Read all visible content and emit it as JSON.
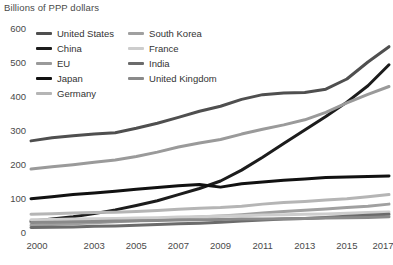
{
  "chart_data": {
    "type": "line",
    "title": "",
    "ylabel": "Billions of PPP dollars",
    "xlabel": "",
    "ylim": [
      0,
      600
    ],
    "yticks": [
      0,
      100,
      200,
      300,
      400,
      500,
      600
    ],
    "xticks": [
      "2000",
      "2003",
      "2005",
      "2007",
      "2009",
      "2011",
      "2013",
      "2015",
      "2017"
    ],
    "x": [
      2000,
      2001,
      2002,
      2003,
      2004,
      2005,
      2006,
      2007,
      2008,
      2009,
      2010,
      2011,
      2012,
      2013,
      2014,
      2015,
      2016,
      2017
    ],
    "grid": false,
    "legend_position": "top-left",
    "series": [
      {
        "name": "United States",
        "color": "#4f4f4f",
        "width": 3.0,
        "values": [
          268,
          277,
          283,
          288,
          292,
          305,
          320,
          337,
          355,
          370,
          390,
          404,
          409,
          410,
          420,
          450,
          500,
          545
        ]
      },
      {
        "name": "China",
        "color": "#1c1c1c",
        "width": 3.0,
        "values": [
          32,
          38,
          45,
          54,
          65,
          78,
          92,
          110,
          128,
          150,
          182,
          220,
          260,
          300,
          340,
          382,
          430,
          492
        ]
      },
      {
        "name": "EU",
        "color": "#9a9a9a",
        "width": 3.0,
        "values": [
          185,
          192,
          198,
          205,
          212,
          222,
          235,
          250,
          262,
          272,
          288,
          302,
          315,
          330,
          352,
          380,
          405,
          428
        ]
      },
      {
        "name": "Japan",
        "color": "#111111",
        "width": 3.0,
        "values": [
          98,
          104,
          110,
          115,
          120,
          126,
          131,
          136,
          140,
          132,
          142,
          147,
          152,
          156,
          160,
          162,
          163,
          165
        ]
      },
      {
        "name": "Germany",
        "color": "#b5b5b5",
        "width": 3.0,
        "values": [
          52,
          54,
          56,
          57,
          58,
          60,
          63,
          67,
          70,
          72,
          76,
          82,
          87,
          90,
          94,
          98,
          104,
          110
        ]
      },
      {
        "name": "South Korea",
        "color": "#a0a0a0",
        "width": 3.0,
        "values": [
          20,
          22,
          24,
          27,
          30,
          33,
          37,
          41,
          44,
          47,
          51,
          56,
          60,
          64,
          68,
          72,
          76,
          82
        ]
      },
      {
        "name": "France",
        "color": "#cdcdcd",
        "width": 3.0,
        "values": [
          36,
          37,
          38,
          39,
          40,
          41,
          42,
          44,
          45,
          47,
          48,
          50,
          51,
          52,
          53,
          55,
          57,
          59
        ]
      },
      {
        "name": "India",
        "color": "#6b6b6b",
        "width": 3.0,
        "values": [
          13,
          14,
          15,
          17,
          18,
          20,
          22,
          24,
          26,
          29,
          32,
          35,
          38,
          40,
          43,
          46,
          49,
          52
        ]
      },
      {
        "name": "United Kingdom",
        "color": "#8a8a8a",
        "width": 3.0,
        "values": [
          28,
          29,
          30,
          31,
          32,
          33,
          34,
          35,
          36,
          37,
          38,
          38,
          39,
          40,
          41,
          42,
          43,
          45
        ]
      }
    ]
  },
  "legend": {
    "columns": [
      [
        "United States",
        "China",
        "EU",
        "Japan",
        "Germany"
      ],
      [
        "South Korea",
        "France",
        "India",
        "United Kingdom"
      ]
    ]
  }
}
